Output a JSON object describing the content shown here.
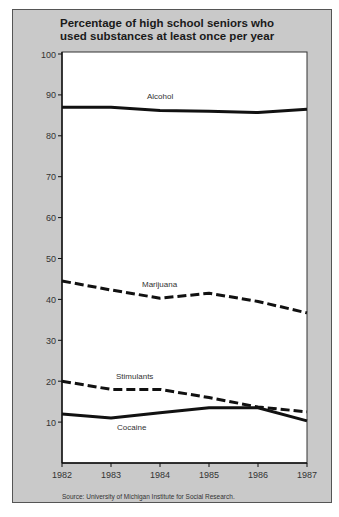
{
  "chart_data": {
    "type": "line",
    "title": "Percentage of high school seniors who used substances at least once per year",
    "xlabel": "",
    "ylabel": "",
    "x": [
      "1982",
      "1983",
      "1984",
      "1985",
      "1986",
      "1987"
    ],
    "ylim": [
      0,
      100
    ],
    "yticks": [
      10,
      20,
      30,
      40,
      50,
      60,
      70,
      80,
      90,
      100
    ],
    "grid": false,
    "legend_position": "inline labels",
    "series": [
      {
        "name": "Alcohol",
        "style": "solid",
        "values": [
          87,
          87,
          86.2,
          86,
          85.7,
          86.5
        ]
      },
      {
        "name": "Marijuana",
        "style": "dashed",
        "values": [
          44.5,
          42.3,
          40.3,
          41.5,
          39.5,
          36.7
        ]
      },
      {
        "name": "Stimulants",
        "style": "dashed",
        "values": [
          20,
          18,
          18,
          16,
          13.7,
          12.5
        ]
      },
      {
        "name": "Cocaine",
        "style": "solid",
        "values": [
          12,
          11,
          12.3,
          13.5,
          13.5,
          10.3
        ]
      }
    ],
    "annotations": [
      "Source: University of Michigan Institute for Social Research."
    ]
  },
  "title_line1": "Percentage of high school seniors who",
  "title_line2": "used substances at least once per year",
  "source": "Source: University of Michigan Institute for Social Research."
}
